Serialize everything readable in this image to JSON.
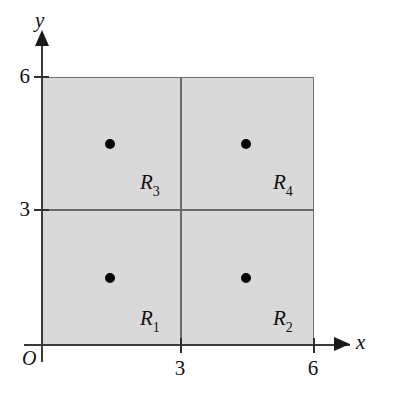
{
  "figure": {
    "origin_label": "O",
    "colors": {
      "shading": "#d9d9d9",
      "grid_line": "#6b6b6b",
      "axis": "#3a3a3a",
      "dot": "#000000",
      "text": "#111111"
    }
  },
  "axes": {
    "x": {
      "name": "x",
      "ticks": [
        {
          "value": 3,
          "label": "3"
        },
        {
          "value": 6,
          "label": "6"
        }
      ],
      "range": [
        0,
        6
      ],
      "arrow": true
    },
    "y": {
      "name": "y",
      "ticks": [
        {
          "value": 3,
          "label": "3"
        },
        {
          "value": 6,
          "label": "6"
        }
      ],
      "range": [
        0,
        6
      ],
      "arrow": true
    }
  },
  "chart_data": {
    "type": "scatter",
    "title": "",
    "xlabel": "x",
    "ylabel": "y",
    "xlim": [
      0,
      6
    ],
    "ylim": [
      0,
      6
    ],
    "grid": true,
    "shaded_region": {
      "x0": 0,
      "y0": 0,
      "x1": 6,
      "y1": 6
    },
    "grid_lines": {
      "vertical": [
        3
      ],
      "horizontal": [
        3
      ]
    },
    "regions": [
      {
        "id": "R1",
        "label": "R",
        "subscript": "1",
        "x0": 0,
        "y0": 0,
        "x1": 3,
        "y1": 3,
        "sample_point": [
          1.5,
          1.5
        ]
      },
      {
        "id": "R2",
        "label": "R",
        "subscript": "2",
        "x0": 3,
        "y0": 0,
        "x1": 6,
        "y1": 3,
        "sample_point": [
          4.5,
          1.5
        ]
      },
      {
        "id": "R3",
        "label": "R",
        "subscript": "3",
        "x0": 0,
        "y0": 3,
        "x1": 3,
        "y1": 6,
        "sample_point": [
          1.5,
          4.5
        ]
      },
      {
        "id": "R4",
        "label": "R",
        "subscript": "4",
        "x0": 3,
        "y0": 3,
        "x1": 6,
        "y1": 6,
        "sample_point": [
          4.5,
          4.5
        ]
      }
    ],
    "points": [
      {
        "x": 1.5,
        "y": 1.5
      },
      {
        "x": 4.5,
        "y": 1.5
      },
      {
        "x": 1.5,
        "y": 4.5
      },
      {
        "x": 4.5,
        "y": 4.5
      }
    ]
  }
}
